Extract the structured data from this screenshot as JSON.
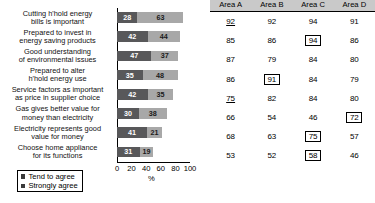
{
  "chart_data": {
    "type": "bar",
    "orientation": "horizontal",
    "stacked": true,
    "title": "",
    "xlabel": "%",
    "ylabel": "",
    "xlim": [
      0,
      100
    ],
    "xticks": [
      "0",
      "20",
      "40",
      "60",
      "80",
      "100"
    ],
    "grid": false,
    "legend_position": "bottom-left",
    "categories": [
      "Cutting h'hold energy\nbills is important",
      "Prepared to invest in\nenergy saving products",
      "Good understanding\nof environmental issues",
      "Prepared to alter\nh'hold energy use",
      "Service factors as important\nas price in supplier choice",
      "Gas gives better value for\nmoney than electricity",
      "Electricity represents good\nvalue for money",
      "Choose home appliance\nfor its functions"
    ],
    "series": [
      {
        "name": "Strongly agree",
        "color": "#58585a",
        "values": [
          28,
          42,
          47,
          35,
          42,
          30,
          41,
          31
        ]
      },
      {
        "name": "Tend to agree",
        "color": "#a8a8a8",
        "values": [
          63,
          44,
          37,
          48,
          35,
          38,
          21,
          19
        ]
      }
    ],
    "totals": [
      91,
      86,
      84,
      83,
      77,
      68,
      62,
      50
    ]
  },
  "legend": {
    "items": [
      {
        "label": "Tend to agree",
        "swatch": "legend-swatch-tend"
      },
      {
        "label": "Strongly agree",
        "swatch": "legend-swatch-strongly"
      }
    ]
  },
  "axis": {
    "x_label": "%",
    "ticks": [
      {
        "value": "0",
        "pos": 0
      },
      {
        "value": "20",
        "pos": 20
      },
      {
        "value": "40",
        "pos": 40
      },
      {
        "value": "60",
        "pos": 60
      },
      {
        "value": "80",
        "pos": 80
      },
      {
        "value": "100",
        "pos": 100
      }
    ]
  },
  "table": {
    "headers": [
      "Area A",
      "Area B",
      "Area C",
      "Area D"
    ],
    "rows": [
      {
        "cells": [
          {
            "value": "92",
            "boxed": false,
            "underlined": true
          },
          {
            "value": "92",
            "boxed": false,
            "underlined": false
          },
          {
            "value": "94",
            "boxed": false,
            "underlined": false
          },
          {
            "value": "91",
            "boxed": false,
            "underlined": false
          }
        ]
      },
      {
        "cells": [
          {
            "value": "85",
            "boxed": false,
            "underlined": false
          },
          {
            "value": "86",
            "boxed": false,
            "underlined": false
          },
          {
            "value": "94",
            "boxed": true,
            "underlined": false
          },
          {
            "value": "86",
            "boxed": false,
            "underlined": false
          }
        ]
      },
      {
        "cells": [
          {
            "value": "87",
            "boxed": false,
            "underlined": false
          },
          {
            "value": "79",
            "boxed": false,
            "underlined": false
          },
          {
            "value": "84",
            "boxed": false,
            "underlined": false
          },
          {
            "value": "80",
            "boxed": false,
            "underlined": false
          }
        ]
      },
      {
        "cells": [
          {
            "value": "86",
            "boxed": false,
            "underlined": false
          },
          {
            "value": "91",
            "boxed": true,
            "underlined": false
          },
          {
            "value": "84",
            "boxed": false,
            "underlined": false
          },
          {
            "value": "79",
            "boxed": false,
            "underlined": false
          }
        ]
      },
      {
        "cells": [
          {
            "value": "75",
            "boxed": false,
            "underlined": true
          },
          {
            "value": "82",
            "boxed": false,
            "underlined": false
          },
          {
            "value": "84",
            "boxed": false,
            "underlined": false
          },
          {
            "value": "80",
            "boxed": false,
            "underlined": false
          }
        ]
      },
      {
        "cells": [
          {
            "value": "66",
            "boxed": false,
            "underlined": false
          },
          {
            "value": "54",
            "boxed": false,
            "underlined": false
          },
          {
            "value": "46",
            "boxed": false,
            "underlined": false
          },
          {
            "value": "72",
            "boxed": true,
            "underlined": false
          }
        ]
      },
      {
        "cells": [
          {
            "value": "68",
            "boxed": false,
            "underlined": false
          },
          {
            "value": "63",
            "boxed": false,
            "underlined": false
          },
          {
            "value": "75",
            "boxed": true,
            "underlined": false
          },
          {
            "value": "57",
            "boxed": false,
            "underlined": false
          }
        ]
      },
      {
        "cells": [
          {
            "value": "53",
            "boxed": false,
            "underlined": false
          },
          {
            "value": "52",
            "boxed": false,
            "underlined": false
          },
          {
            "value": "58",
            "boxed": true,
            "underlined": false
          },
          {
            "value": "46",
            "boxed": false,
            "underlined": false
          }
        ]
      }
    ]
  },
  "colors": {
    "strongly_agree": "#58585a",
    "tend_to_agree": "#a8a8a8",
    "table_header_bg": "#c9c9c9"
  }
}
